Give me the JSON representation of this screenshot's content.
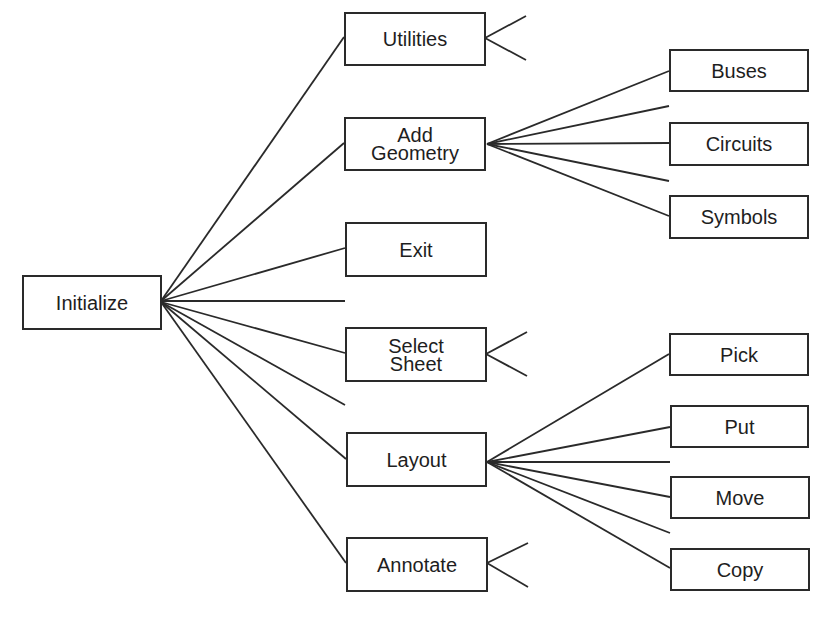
{
  "diagram": {
    "type": "menu-hierarchy-tree",
    "line_color": "#2a2a2a",
    "root": {
      "id": "initialize",
      "label": "Initialize",
      "x": 22,
      "y": 275,
      "w": 140,
      "h": 55
    },
    "level1": [
      {
        "id": "utilities",
        "label": "Utilities",
        "x": 344,
        "y": 12,
        "w": 142,
        "h": 54
      },
      {
        "id": "add-geometry",
        "label": "Add\nGeometry",
        "x": 344,
        "y": 117,
        "w": 142,
        "h": 54
      },
      {
        "id": "exit",
        "label": "Exit",
        "x": 345,
        "y": 222,
        "w": 142,
        "h": 55
      },
      {
        "id": "select-sheet",
        "label": "Select\nSheet",
        "x": 345,
        "y": 327,
        "w": 142,
        "h": 55
      },
      {
        "id": "layout",
        "label": "Layout",
        "x": 346,
        "y": 432,
        "w": 141,
        "h": 55
      },
      {
        "id": "annotate",
        "label": "Annotate",
        "x": 346,
        "y": 537,
        "w": 142,
        "h": 55
      }
    ],
    "level2_add_geometry": [
      {
        "id": "buses",
        "label": "Buses",
        "x": 669,
        "y": 49,
        "w": 140,
        "h": 43
      },
      {
        "id": "circuits",
        "label": "Circuits",
        "x": 669,
        "y": 122,
        "w": 140,
        "h": 44
      },
      {
        "id": "symbols",
        "label": "Symbols",
        "x": 669,
        "y": 195,
        "w": 140,
        "h": 44
      }
    ],
    "level2_layout": [
      {
        "id": "pick",
        "label": "Pick",
        "x": 669,
        "y": 333,
        "w": 140,
        "h": 43
      },
      {
        "id": "put",
        "label": "Put",
        "x": 670,
        "y": 405,
        "w": 139,
        "h": 43
      },
      {
        "id": "move",
        "label": "Move",
        "x": 670,
        "y": 476,
        "w": 140,
        "h": 43
      },
      {
        "id": "copy",
        "label": "Copy",
        "x": 670,
        "y": 548,
        "w": 140,
        "h": 43
      }
    ],
    "edges": [
      {
        "from": "initialize",
        "x1": 161,
        "y1": 301,
        "x2": 344,
        "y2": 37
      },
      {
        "from": "initialize",
        "x1": 161,
        "y1": 301,
        "x2": 344,
        "y2": 143
      },
      {
        "from": "initialize",
        "x1": 161,
        "y1": 301,
        "x2": 345,
        "y2": 248
      },
      {
        "from": "initialize",
        "x1": 161,
        "y1": 301,
        "x2": 345,
        "y2": 301
      },
      {
        "from": "initialize",
        "x1": 161,
        "y1": 302,
        "x2": 345,
        "y2": 353
      },
      {
        "from": "initialize",
        "x1": 161,
        "y1": 302,
        "x2": 345,
        "y2": 405
      },
      {
        "from": "initialize",
        "x1": 161,
        "y1": 302,
        "x2": 346,
        "y2": 459
      },
      {
        "from": "initialize",
        "x1": 161,
        "y1": 302,
        "x2": 346,
        "y2": 563
      },
      {
        "from": "utilities",
        "x1": 485,
        "y1": 38,
        "x2": 526,
        "y2": 16
      },
      {
        "from": "utilities",
        "x1": 485,
        "y1": 38,
        "x2": 526,
        "y2": 60
      },
      {
        "from": "add-geometry",
        "x1": 487,
        "y1": 144,
        "x2": 669,
        "y2": 71
      },
      {
        "from": "add-geometry",
        "x1": 487,
        "y1": 144,
        "x2": 669,
        "y2": 106
      },
      {
        "from": "add-geometry",
        "x1": 487,
        "y1": 144,
        "x2": 669,
        "y2": 143
      },
      {
        "from": "add-geometry",
        "x1": 487,
        "y1": 144,
        "x2": 669,
        "y2": 181
      },
      {
        "from": "add-geometry",
        "x1": 487,
        "y1": 144,
        "x2": 669,
        "y2": 216
      },
      {
        "from": "select-sheet",
        "x1": 486,
        "y1": 354,
        "x2": 527,
        "y2": 332
      },
      {
        "from": "select-sheet",
        "x1": 486,
        "y1": 354,
        "x2": 527,
        "y2": 376
      },
      {
        "from": "layout",
        "x1": 487,
        "y1": 462,
        "x2": 669,
        "y2": 354
      },
      {
        "from": "layout",
        "x1": 487,
        "y1": 462,
        "x2": 670,
        "y2": 427
      },
      {
        "from": "layout",
        "x1": 487,
        "y1": 462,
        "x2": 670,
        "y2": 462
      },
      {
        "from": "layout",
        "x1": 487,
        "y1": 462,
        "x2": 670,
        "y2": 497
      },
      {
        "from": "layout",
        "x1": 487,
        "y1": 462,
        "x2": 670,
        "y2": 533
      },
      {
        "from": "layout",
        "x1": 487,
        "y1": 462,
        "x2": 670,
        "y2": 568
      },
      {
        "from": "annotate",
        "x1": 487,
        "y1": 563,
        "x2": 528,
        "y2": 543
      },
      {
        "from": "annotate",
        "x1": 487,
        "y1": 563,
        "x2": 528,
        "y2": 587
      }
    ]
  }
}
